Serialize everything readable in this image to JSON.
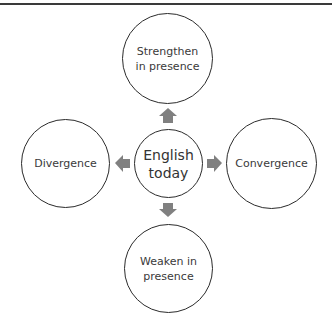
{
  "diagram": {
    "colors": {
      "rule": "#3a3a3a",
      "circle_stroke": "#2b2b2b",
      "text": "#3a3a3a",
      "arrow": "#808080",
      "background": "#ffffff"
    },
    "center": {
      "label_line1": "English",
      "label_line2": "today"
    },
    "top": {
      "label_line1": "Strengthen",
      "label_line2": "in presence",
      "arrow_direction": "up"
    },
    "left": {
      "label": "Divergence",
      "arrow_direction": "left"
    },
    "right": {
      "label": "Convergence",
      "arrow_direction": "right"
    },
    "bottom": {
      "label_line1": "Weaken in",
      "label_line2": "presence",
      "arrow_direction": "down"
    }
  }
}
